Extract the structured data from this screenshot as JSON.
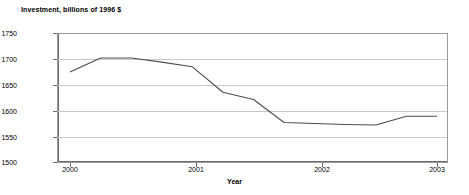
{
  "chart_data": {
    "type": "line",
    "title": "Investment, billions of 1996 $",
    "xlabel": "Year",
    "ylabel": "",
    "ylim": [
      1500,
      1750
    ],
    "xlim": [
      2000,
      2003
    ],
    "grid": true,
    "legend": false,
    "ytick_labels": [
      "1750",
      "1700",
      "1650",
      "1600",
      "1550",
      "1500"
    ],
    "ytick_values": [
      1750,
      1700,
      1650,
      1600,
      1550,
      1500
    ],
    "xtick_labels": [
      "2000",
      "2001",
      "2002",
      "2003"
    ],
    "xtick_values": [
      2000,
      2001,
      2002,
      2003
    ],
    "series": [
      {
        "name": "Investment",
        "color": "#4d4d4d",
        "x": [
          2000.0,
          2000.25,
          2000.5,
          2000.75,
          2001.0,
          2001.25,
          2001.5,
          2001.75,
          2002.0,
          2002.25,
          2002.5,
          2002.75,
          2003.0
        ],
        "values": [
          1675,
          1702,
          1702,
          1694,
          1685,
          1636,
          1622,
          1578,
          1576,
          1574,
          1573,
          1590,
          1590
        ]
      }
    ]
  }
}
